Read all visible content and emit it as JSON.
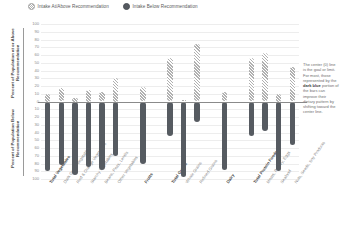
{
  "legend": {
    "items": [
      {
        "label": "Intake At/Above Recommendation",
        "style": "hatch",
        "color": "#bfbfbf",
        "icon": "circle-hatched-icon"
      },
      {
        "label": "Intake Below Recommendation",
        "style": "solid",
        "color": "#565b61",
        "icon": "circle-solid-icon"
      }
    ]
  },
  "axes": {
    "upper_title": "Percent of Population at or Above Recommendation",
    "lower_title": "Percent of Population Below Recommendation",
    "ticks_upper": [
      "100",
      "90",
      "80",
      "70",
      "60",
      "50",
      "40",
      "30",
      "20",
      "10"
    ],
    "tick_zero": "0",
    "ticks_lower": [
      "10",
      "20",
      "30",
      "40",
      "50",
      "60",
      "70",
      "80",
      "90",
      "100"
    ]
  },
  "note": {
    "line1": "The center (0)",
    "line2": "line is the",
    "line3": "goal or limit.",
    "line4": "For most, those",
    "line5": "represented by",
    "line6": "the ",
    "bold": "dark blue",
    "line7": "portion of the",
    "line8": "bars can",
    "line9": "improve their",
    "line10": "dietary pattern",
    "line11": "by shifting",
    "line12": "toward the",
    "line13": "center line."
  },
  "chart_data": {
    "type": "bar",
    "xlabel": "",
    "ylabel": "Percent of Population",
    "ylim": [
      -100,
      100
    ],
    "grid": true,
    "legend_position": "top-left",
    "orientation": "diverging-vertical",
    "series": [
      {
        "name": "Intake At/Above Recommendation",
        "color": "#bfbfbf",
        "fill": "hatched"
      },
      {
        "name": "Intake Below Recommendation",
        "color": "#565b61",
        "fill": "solid"
      }
    ],
    "groups": [
      {
        "group": "Vegetables",
        "bars": [
          {
            "category": "Total Vegetables",
            "major": true,
            "above": 10,
            "below": -90
          },
          {
            "category": "Dark Green Vegetables",
            "major": false,
            "above": 18,
            "below": -82
          },
          {
            "category": "Red & Orange Vegetables",
            "major": false,
            "above": 5,
            "below": -95
          },
          {
            "category": "Starchy Vegetables",
            "major": false,
            "above": 15,
            "below": -85
          },
          {
            "category": "Beans, Peas, Lentils",
            "major": false,
            "above": 12,
            "below": -88
          },
          {
            "category": "Other Vegetables",
            "major": false,
            "above": 30,
            "below": -70
          }
        ]
      },
      {
        "group": "Fruits",
        "bars": [
          {
            "category": "Fruits",
            "major": true,
            "above": 19,
            "below": -81
          }
        ]
      },
      {
        "group": "Grains",
        "bars": [
          {
            "category": "Total Grains",
            "major": true,
            "above": 56,
            "below": -44
          },
          {
            "category": "Whole Grains",
            "major": false,
            "above": 2,
            "below": -98
          },
          {
            "category": "Refined Grains",
            "major": false,
            "above": 74,
            "below": -26
          }
        ]
      },
      {
        "group": "Dairy",
        "bars": [
          {
            "category": "Dairy",
            "major": true,
            "above": 12,
            "below": -88
          }
        ]
      },
      {
        "group": "Protein Foods",
        "bars": [
          {
            "category": "Total Protein Foods",
            "major": true,
            "above": 56,
            "below": -44
          },
          {
            "category": "Meats, Poultry, Eggs",
            "major": false,
            "above": 62,
            "below": -38
          },
          {
            "category": "Seafood",
            "major": false,
            "above": 10,
            "below": -90
          },
          {
            "category": "Nuts, Seeds, Soy Products",
            "major": false,
            "above": 44,
            "below": -56
          }
        ]
      }
    ]
  }
}
